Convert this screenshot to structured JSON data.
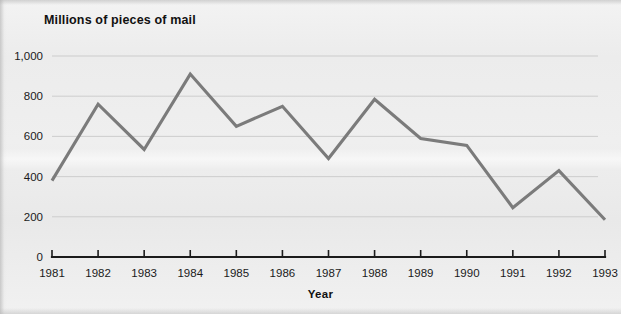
{
  "chart_data": {
    "type": "line",
    "title": "Millions of pieces of mail",
    "xlabel": "Year",
    "ylabel": "",
    "categories": [
      "1981",
      "1982",
      "1983",
      "1984",
      "1985",
      "1986",
      "1987",
      "1988",
      "1989",
      "1990",
      "1991",
      "1992",
      "1993"
    ],
    "x": [
      1981,
      1982,
      1983,
      1984,
      1985,
      1986,
      1987,
      1988,
      1989,
      1990,
      1991,
      1992,
      1993
    ],
    "values": [
      380,
      760,
      535,
      910,
      650,
      750,
      490,
      785,
      590,
      555,
      245,
      430,
      185
    ],
    "series": [
      {
        "name": "Millions of pieces of mail",
        "values": [
          380,
          760,
          535,
          910,
          650,
          750,
          490,
          785,
          590,
          555,
          245,
          430,
          185
        ]
      }
    ],
    "ylim": [
      0,
      1000
    ],
    "yticks": [
      0,
      200,
      400,
      600,
      800,
      1000
    ],
    "ytick_labels": [
      "0",
      "200",
      "400",
      "600",
      "800",
      "1,000"
    ],
    "xlim": [
      1981,
      1993
    ],
    "grid": true,
    "grid_axis": "y",
    "legend": false,
    "legend_position": "none",
    "line_color": "#7b7b7b",
    "axis_color": "#1b1b1b",
    "gridline_color": "#c9c9c9",
    "background_color": "#efefef"
  },
  "figure": {
    "title": "Millions of pieces of mail",
    "x_axis_title": "Year",
    "y_tick_labels": [
      "1,000",
      "800",
      "600",
      "400",
      "200",
      "0"
    ],
    "x_tick_labels": [
      "1981",
      "1982",
      "1983",
      "1984",
      "1985",
      "1986",
      "1987",
      "1988",
      "1989",
      "1990",
      "1991",
      "1992",
      "1993"
    ]
  }
}
